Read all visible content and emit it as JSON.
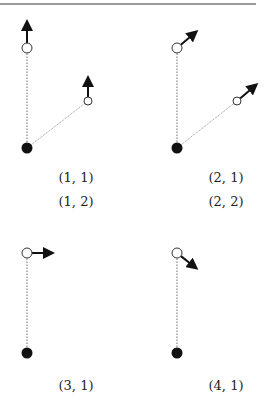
{
  "rule": {
    "x1": 0,
    "x2": 256,
    "y": 4,
    "color": "#9a9a9a",
    "width": 2
  },
  "colors": {
    "ink": "#111111",
    "link": "#888888",
    "bob_fill": "#ffffff"
  },
  "panels": [
    {
      "id": "panel-1",
      "pivot": {
        "x": 27,
        "y": 148
      },
      "bobs": [
        {
          "x": 27,
          "y": 48,
          "r": 5,
          "link_style": "dotted",
          "arrow": {
            "x": 27,
            "y": 22
          }
        },
        {
          "x": 88,
          "y": 101,
          "r": 4,
          "link_style": "thin",
          "arrow": {
            "x": 88,
            "y": 78
          }
        }
      ]
    },
    {
      "id": "panel-2",
      "pivot": {
        "x": 177,
        "y": 148
      },
      "bobs": [
        {
          "x": 177,
          "y": 48,
          "r": 5,
          "link_style": "dotted",
          "arrow": {
            "x": 196,
            "y": 32
          }
        },
        {
          "x": 237,
          "y": 101,
          "r": 4,
          "link_style": "thin",
          "arrow": {
            "x": 256,
            "y": 85
          }
        }
      ]
    },
    {
      "id": "panel-3",
      "pivot": {
        "x": 27,
        "y": 353
      },
      "bobs": [
        {
          "x": 27,
          "y": 253,
          "r": 5,
          "link_style": "dotted",
          "arrow": {
            "x": 52,
            "y": 253
          }
        }
      ]
    },
    {
      "id": "panel-4",
      "pivot": {
        "x": 177,
        "y": 353
      },
      "bobs": [
        {
          "x": 177,
          "y": 253,
          "r": 5,
          "link_style": "dotted",
          "arrow": {
            "x": 196,
            "y": 268
          }
        }
      ]
    }
  ],
  "labels": {
    "l11": {
      "text": "(1, 1)",
      "x": 76,
      "y": 170
    },
    "l12": {
      "text": "(1, 2)",
      "x": 76,
      "y": 194
    },
    "l21": {
      "text": "(2, 1)",
      "x": 226,
      "y": 170
    },
    "l22": {
      "text": "(2, 2)",
      "x": 226,
      "y": 194
    },
    "l31": {
      "text": "(3, 1)",
      "x": 76,
      "y": 378
    },
    "l41": {
      "text": "(4, 1)",
      "x": 226,
      "y": 378
    }
  }
}
